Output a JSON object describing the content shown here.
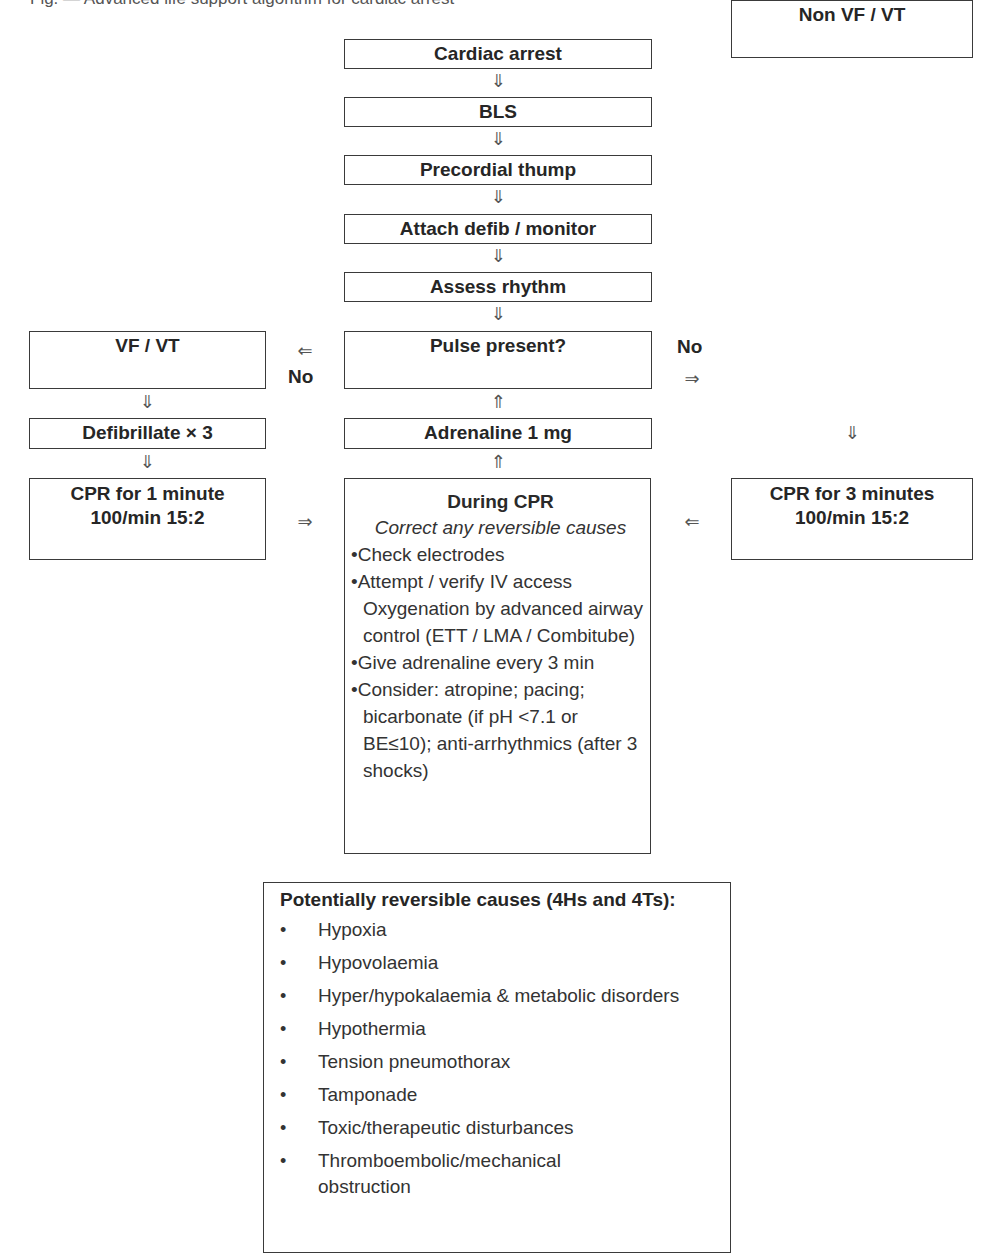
{
  "header": {
    "cut_off_text": "Fig. — Advanced life support algorithm for cardiac arrest"
  },
  "flow": {
    "main_steps": [
      {
        "label": "Cardiac arrest"
      },
      {
        "label": "BLS"
      },
      {
        "label": "Precordial thump"
      },
      {
        "label": "Attach defib / monitor"
      },
      {
        "label": "Assess rhythm"
      }
    ],
    "decision": {
      "label": "Pulse present?"
    },
    "adrenaline": {
      "label": "Adrenaline 1 mg"
    },
    "left_branch": {
      "no_label": "No",
      "rhythm": "VF / VT",
      "action": "Defibrillate × 3",
      "cpr_line1": "CPR for 1 minute",
      "cpr_line2": "100/min 15:2"
    },
    "right_branch": {
      "no_label": "No",
      "rhythm": "Non VF / VT",
      "cpr_line1": "CPR for 3 minutes",
      "cpr_line2": "100/min 15:2"
    },
    "during_cpr": {
      "heading": "During CPR",
      "subheading": "Correct any reversible causes",
      "items": [
        {
          "bullet": "•",
          "text": "Check electrodes"
        },
        {
          "bullet": "•",
          "text": "Attempt / verify IV access"
        },
        {
          "bullet": "",
          "text": "Oxygenation by advanced airway control (ETT / LMA / Combitube)"
        },
        {
          "bullet": "•",
          "text": "Give adrenaline every 3 min"
        },
        {
          "bullet": "•",
          "text": "Consider: atropine; pacing; bicarbonate (if pH <7.1 or BE≤10); anti-arrhythmics (after 3 shocks)"
        }
      ]
    },
    "arrows": {
      "down": "⇓",
      "up": "⇑",
      "left": "⇐",
      "right": "⇒"
    }
  },
  "reversible_causes": {
    "heading": "Potentially reversible causes (4Hs and 4Ts):",
    "bullet": "•",
    "items": [
      "Hypoxia",
      "Hypovolaemia",
      "Hyper/hypokalaemia & metabolic disorders",
      "Hypothermia",
      "Tension pneumothorax",
      "Tamponade",
      "Toxic/therapeutic disturbances",
      "Thromboembolic/mechanical obstruction"
    ]
  }
}
